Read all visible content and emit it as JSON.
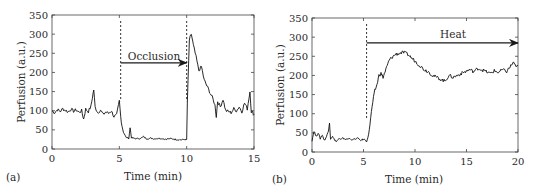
{
  "chart_data": [
    {
      "type": "line",
      "panel_label": "(a)",
      "title": "",
      "xlabel": "Time (min)",
      "ylabel": "Perfusion (a.u.)",
      "xlim": [
        0,
        15
      ],
      "ylim": [
        0,
        350
      ],
      "xticks": [
        0,
        5,
        10,
        15
      ],
      "yticks": [
        0,
        50,
        100,
        150,
        200,
        250,
        300,
        350
      ],
      "grid": false,
      "legend": null,
      "markers": [
        {
          "x": 5.1,
          "style": "dashed"
        },
        {
          "x": 10.0,
          "style": "dashed"
        }
      ],
      "annotation": {
        "text": "Occlusion",
        "arrow_from": 5.1,
        "arrow_to": 10.0,
        "arrow_y": 225
      },
      "series": [
        {
          "name": "Perfusion",
          "x": [
            0,
            0.2,
            0.4,
            0.6,
            0.8,
            1.0,
            1.2,
            1.4,
            1.6,
            1.8,
            2.0,
            2.2,
            2.35,
            2.5,
            2.7,
            2.9,
            3.0,
            3.1,
            3.2,
            3.4,
            3.6,
            3.8,
            4.0,
            4.2,
            4.4,
            4.6,
            4.8,
            5.0,
            5.1,
            5.2,
            5.3,
            5.5,
            5.7,
            5.8,
            5.9,
            6.0,
            6.3,
            6.6,
            6.8,
            7.0,
            7.3,
            7.6,
            8.0,
            8.4,
            8.8,
            9.2,
            9.6,
            9.9,
            10.0,
            10.05,
            10.2,
            10.35,
            10.5,
            10.7,
            10.9,
            11.1,
            11.3,
            11.5,
            11.7,
            11.9,
            12.1,
            12.2,
            12.3,
            12.5,
            12.7,
            12.9,
            13.1,
            13.3,
            13.5,
            13.7,
            13.9,
            14.1,
            14.3,
            14.5,
            14.7,
            14.8,
            14.9,
            15.0
          ],
          "y": [
            100,
            95,
            103,
            98,
            105,
            101,
            97,
            104,
            99,
            102,
            96,
            100,
            78,
            104,
            98,
            112,
            135,
            155,
            110,
            95,
            102,
            90,
            97,
            93,
            100,
            85,
            88,
            125,
            85,
            60,
            45,
            30,
            28,
            55,
            30,
            28,
            27,
            28,
            32,
            27,
            28,
            27,
            28,
            26,
            27,
            25,
            24,
            25,
            24,
            120,
            285,
            300,
            270,
            240,
            205,
            215,
            180,
            165,
            150,
            135,
            115,
            85,
            125,
            110,
            130,
            100,
            98,
            95,
            105,
            100,
            110,
            98,
            120,
            105,
            150,
            98,
            95,
            90
          ]
        }
      ]
    },
    {
      "type": "line",
      "panel_label": "(b)",
      "title": "",
      "xlabel": "Time (min)",
      "ylabel": "Perfusion (a.u.)",
      "xlim": [
        0,
        20
      ],
      "ylim": [
        0,
        350
      ],
      "xticks": [
        0,
        5,
        10,
        15,
        20
      ],
      "yticks": [
        0,
        50,
        100,
        150,
        200,
        250,
        300,
        350
      ],
      "grid": false,
      "legend": null,
      "markers": [
        {
          "x": 5.3,
          "style": "dashed"
        }
      ],
      "annotation": {
        "text": "Heat",
        "arrow_from": 5.3,
        "arrow_to": 20,
        "arrow_y": 285
      },
      "series": [
        {
          "name": "Perfusion",
          "x": [
            0,
            0.2,
            0.4,
            0.6,
            0.8,
            1.0,
            1.2,
            1.4,
            1.6,
            1.7,
            1.8,
            2.0,
            2.2,
            2.4,
            2.6,
            2.8,
            3.0,
            3.3,
            3.6,
            4.0,
            4.4,
            4.8,
            5.0,
            5.3,
            5.5,
            5.7,
            5.9,
            6.1,
            6.3,
            6.5,
            6.7,
            6.9,
            7.1,
            7.3,
            7.5,
            7.8,
            8.1,
            8.5,
            8.9,
            9.3,
            9.7,
            10.1,
            10.5,
            10.9,
            11.3,
            11.7,
            12.1,
            12.5,
            12.9,
            13.3,
            13.7,
            14.1,
            14.5,
            14.9,
            15.3,
            15.7,
            16.1,
            16.5,
            16.9,
            17.3,
            17.7,
            18.1,
            18.5,
            18.9,
            19.3,
            19.6,
            19.8,
            20.0
          ],
          "y": [
            30,
            55,
            40,
            50,
            35,
            45,
            30,
            40,
            55,
            80,
            35,
            42,
            30,
            28,
            35,
            32,
            36,
            33,
            35,
            32,
            36,
            30,
            34,
            28,
            45,
            90,
            130,
            160,
            175,
            200,
            205,
            195,
            210,
            225,
            240,
            248,
            255,
            258,
            260,
            255,
            245,
            235,
            225,
            215,
            210,
            200,
            195,
            190,
            185,
            200,
            195,
            200,
            205,
            210,
            215,
            210,
            218,
            215,
            210,
            205,
            212,
            208,
            215,
            210,
            225,
            235,
            220,
            225
          ]
        }
      ]
    }
  ]
}
